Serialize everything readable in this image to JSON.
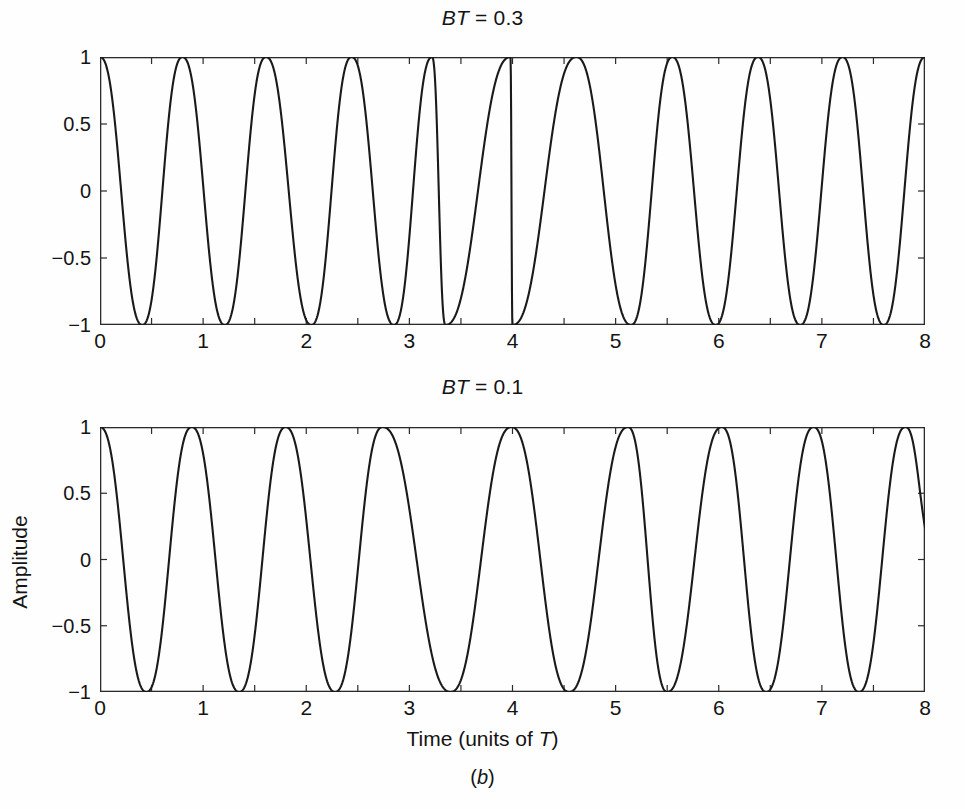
{
  "figure": {
    "caption_prefix": "(",
    "caption_letter": "b",
    "caption_suffix": ")",
    "caption": "(b)",
    "background_color": "#fefefe",
    "curve_color": "#1a1a1a",
    "axis_color": "#2b2b2b"
  },
  "axes": {
    "x_label_text_before": "Time (units of ",
    "x_label_symbol": "T",
    "x_label_text_after": ")",
    "x_label": "Time (units of T)",
    "y_label": "Amplitude",
    "x_ticks": [
      "0",
      "1",
      "2",
      "3",
      "4",
      "5",
      "6",
      "7",
      "8"
    ],
    "y_ticks": [
      "1",
      "0.5",
      "0",
      "−0.5",
      "−1"
    ]
  },
  "panels": [
    {
      "id": "top",
      "title_symbol": "BT",
      "title_equals": " = ",
      "title_value": "0.3",
      "title": "BT = 0.3"
    },
    {
      "id": "bottom",
      "title_symbol": "BT",
      "title_equals": " = ",
      "title_value": "0.1",
      "title": "BT = 0.1"
    }
  ],
  "chart_data": [
    {
      "type": "line",
      "panel": "top",
      "title": "BT = 0.3",
      "xlabel": "Time (units of T)",
      "ylabel": "Amplitude",
      "xlim": [
        0,
        8
      ],
      "ylim": [
        -1,
        1
      ],
      "xticks": [
        0,
        1,
        2,
        3,
        4,
        5,
        6,
        7,
        8
      ],
      "xticks_minor_step": 0.5,
      "yticks": [
        -1,
        -0.5,
        0,
        0.5,
        1
      ],
      "grid": false,
      "legend": "none",
      "description": "Frequency-modulated carrier; instantaneous frequency is highest near the ends of the record and lowest near the centre (t = 4).",
      "peak_times": [
        0.0,
        0.8,
        1.61,
        2.44,
        3.22,
        3.98,
        4.0,
        5.15,
        5.97,
        6.79,
        7.6
      ],
      "trough_times": [
        0.41,
        1.21,
        2.05,
        2.85,
        3.35,
        4.62,
        5.55,
        6.38,
        7.2
      ],
      "period_at_edges": 0.8,
      "period_at_centre": 1.15,
      "samples_x": [
        0,
        0.25,
        0.5,
        0.75,
        1,
        1.25,
        1.5,
        1.75,
        2,
        2.25,
        2.5,
        2.75,
        3,
        3.25,
        3.5,
        3.75,
        4,
        4.25,
        4.5,
        4.75,
        5,
        5.25,
        5.5,
        5.75,
        6,
        6.25,
        6.5,
        6.75,
        7,
        7.25,
        7.5,
        7.75,
        8
      ],
      "samples_y": [
        1.0,
        0.29,
        -0.85,
        -0.72,
        0.53,
        -0.97,
        0.44,
        0.77,
        -0.99,
        0.18,
        0.94,
        -0.84,
        -0.4,
        0.99,
        -0.51,
        -0.62,
        1.0,
        -0.62,
        -0.51,
        0.99,
        -0.4,
        -0.84,
        0.94,
        0.18,
        -0.99,
        0.77,
        0.44,
        -0.97,
        0.53,
        -0.72,
        -0.85,
        0.29,
        1.0
      ]
    },
    {
      "type": "line",
      "panel": "bottom",
      "title": "BT = 0.1",
      "xlabel": "Time (units of T)",
      "ylabel": "Amplitude",
      "xlim": [
        0,
        8
      ],
      "ylim": [
        -1,
        1
      ],
      "xticks": [
        0,
        1,
        2,
        3,
        4,
        5,
        6,
        7,
        8
      ],
      "xticks_minor_step": 0.5,
      "yticks": [
        -1,
        -0.5,
        0,
        0.5,
        1
      ],
      "grid": false,
      "legend": "none",
      "description": "Same modulation with narrower Gaussian filter bandwidth; frequency deviation across the record is smoother and smaller than for BT = 0.3.",
      "peak_times": [
        0.0,
        0.89,
        1.8,
        2.74,
        3.99,
        5.12,
        6.03,
        6.92,
        7.81
      ],
      "trough_times": [
        0.45,
        1.35,
        2.28,
        3.4,
        4.55,
        5.5,
        6.46,
        7.36
      ],
      "period_at_edges": 0.9,
      "period_at_centre": 1.12,
      "samples_x": [
        0,
        0.25,
        0.5,
        0.75,
        1,
        1.25,
        1.5,
        1.75,
        2,
        2.25,
        2.5,
        2.75,
        3,
        3.25,
        3.5,
        3.75,
        4,
        4.25,
        4.5,
        4.75,
        5,
        5.25,
        5.5,
        5.75,
        6,
        6.25,
        6.5,
        6.75,
        7,
        7.25,
        7.5,
        7.75,
        8
      ],
      "samples_y": [
        1.0,
        0.46,
        -0.75,
        -0.88,
        0.25,
        0.96,
        -0.44,
        -0.99,
        0.93,
        0.1,
        -0.84,
        0.98,
        0.63,
        -0.65,
        -0.97,
        0.5,
        1.0,
        0.5,
        -0.97,
        -0.65,
        0.63,
        0.98,
        -0.84,
        0.1,
        0.93,
        -0.99,
        -0.44,
        0.96,
        0.25,
        -0.88,
        -0.75,
        0.46,
        0.08
      ]
    }
  ]
}
